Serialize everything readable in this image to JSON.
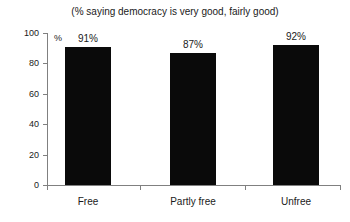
{
  "chart_data": {
    "type": "bar",
    "title": "(% saying democracy is very good, fairly good)",
    "xlabel": "",
    "ylabel": "%",
    "categories": [
      "Free",
      "Partly free",
      "Unfree"
    ],
    "values": [
      91,
      87,
      92
    ],
    "data_labels": [
      "91%",
      "87%",
      "92%"
    ],
    "ylim": [
      0,
      100
    ],
    "yticks": [
      0,
      20,
      40,
      60,
      80,
      100
    ],
    "ytick_labels": [
      "0",
      "20",
      "40",
      "60",
      "80",
      "100"
    ],
    "grid": false,
    "legend": "none",
    "bar_color": "#000000",
    "axis_color": "#808080",
    "background_color": "#ffffff"
  }
}
